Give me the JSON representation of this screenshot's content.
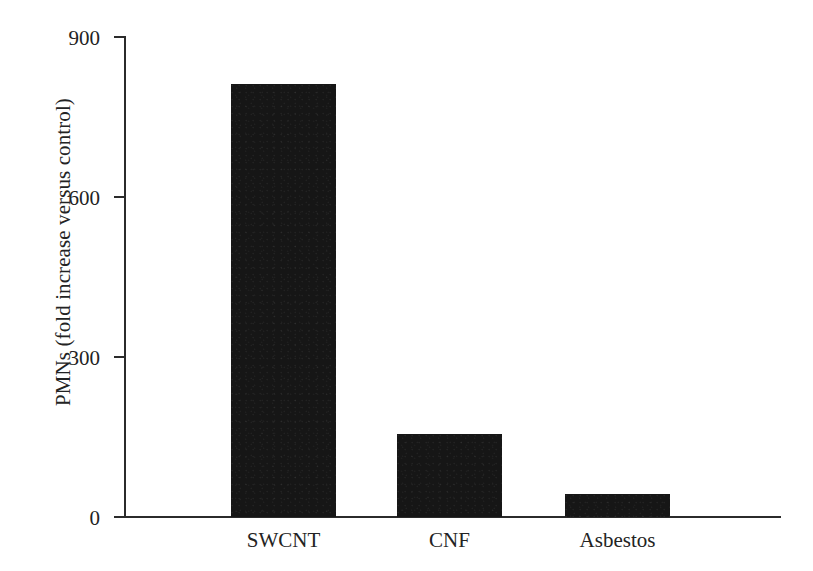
{
  "chart_data": {
    "type": "bar",
    "title": "",
    "subtitle": "",
    "xlabel": "",
    "ylabel": "PMNs (fold increase versus control)",
    "categories": [
      "SWCNT",
      "CNF",
      "Asbestos"
    ],
    "values": [
      810,
      155,
      43
    ],
    "series": [
      {
        "name": "PMNs",
        "values": [
          810,
          155,
          43
        ]
      }
    ],
    "ylim": [
      0,
      900
    ],
    "yticks": [
      0,
      300,
      600,
      900
    ],
    "ytick_labels": [
      "0",
      "300",
      "600",
      "900"
    ],
    "grid": false,
    "legend": false,
    "legend_position": "none",
    "annotations": [],
    "bar_color": "#161616",
    "axis_color": "#2b2b2b",
    "background_color": "#ffffff"
  },
  "axes": {
    "y_title": "PMNs (fold increase versus control)",
    "ticks": [
      {
        "label": "900",
        "value": 900
      },
      {
        "label": "600",
        "value": 600
      },
      {
        "label": "300",
        "value": 300
      },
      {
        "label": "0",
        "value": 0
      }
    ]
  },
  "bars": [
    {
      "label": "SWCNT",
      "value": 810
    },
    {
      "label": "CNF",
      "value": 155
    },
    {
      "label": "Asbestos",
      "value": 43
    }
  ]
}
